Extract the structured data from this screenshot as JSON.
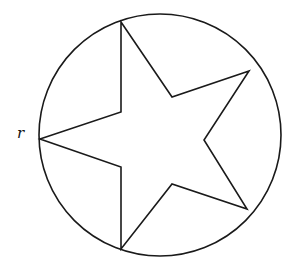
{
  "diagram": {
    "stroke_color": "#1a1a1a",
    "background": "#ffffff",
    "circle": {
      "cx": 160,
      "cy": 135,
      "r": 121
    },
    "star_points": "121,22 172,97 249,71 204,140 247,209 172,184 121,249 121,167 40,139 121,112",
    "label": {
      "text": "r",
      "x": 17,
      "y": 124
    }
  }
}
